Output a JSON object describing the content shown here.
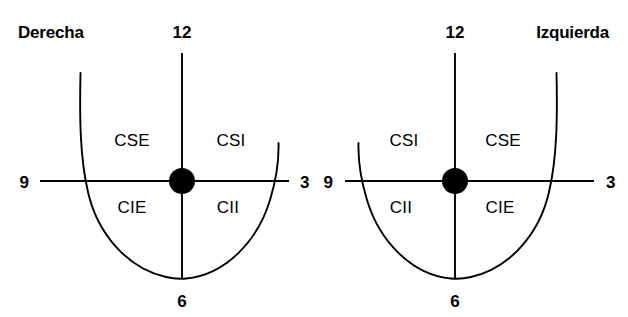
{
  "figure": {
    "background_color": "#ffffff",
    "stroke_color": "#000000"
  },
  "breasts": [
    {
      "id": "right-breast",
      "side_label": "Derecha",
      "side_label_position": "top-left",
      "center": {
        "x": 182,
        "y": 181
      },
      "nipple_radius": 13,
      "clock_marks": [
        {
          "name": "twelve",
          "label": "12",
          "x": 182,
          "y": 33
        },
        {
          "name": "three",
          "label": "3",
          "x": 300,
          "y": 182
        },
        {
          "name": "six",
          "label": "6",
          "x": 182,
          "y": 300
        },
        {
          "name": "nine",
          "label": "9",
          "x": 23,
          "y": 182
        }
      ],
      "quadrants": [
        {
          "name": "upper-outer",
          "code": "CSE",
          "x": 132,
          "y": 139
        },
        {
          "name": "upper-inner",
          "code": "CSI",
          "x": 231,
          "y": 139
        },
        {
          "name": "lower-outer",
          "code": "CIE",
          "x": 132,
          "y": 207
        },
        {
          "name": "lower-inner",
          "code": "CII",
          "x": 228,
          "y": 207
        }
      ]
    },
    {
      "id": "left-breast",
      "side_label": "Izquierda",
      "side_label_position": "top-right",
      "center": {
        "x": 455,
        "y": 181
      },
      "nipple_radius": 13,
      "clock_marks": [
        {
          "name": "twelve",
          "label": "12",
          "x": 455,
          "y": 33
        },
        {
          "name": "three",
          "label": "3",
          "x": 606,
          "y": 182
        },
        {
          "name": "six",
          "label": "6",
          "x": 455,
          "y": 300
        },
        {
          "name": "nine",
          "label": "9",
          "x": 327,
          "y": 182
        }
      ],
      "quadrants": [
        {
          "name": "upper-inner",
          "code": "CSI",
          "x": 404,
          "y": 139
        },
        {
          "name": "upper-outer",
          "code": "CSE",
          "x": 503,
          "y": 139
        },
        {
          "name": "lower-inner",
          "code": "CII",
          "x": 401,
          "y": 207
        },
        {
          "name": "lower-outer",
          "code": "CIE",
          "x": 500,
          "y": 207
        }
      ]
    }
  ],
  "legend": {
    "CSE": "Cuadrante Superior Externo",
    "CSI": "Cuadrante Superior Interno",
    "CIE": "Cuadrante Inferior Externo",
    "CII": "Cuadrante Inferior Interno"
  }
}
